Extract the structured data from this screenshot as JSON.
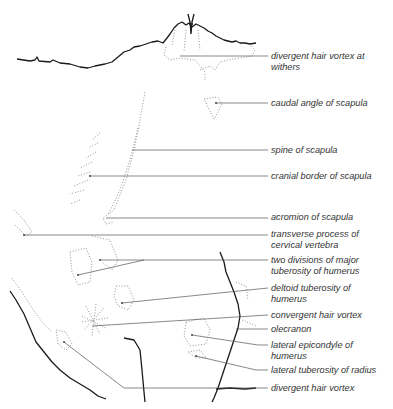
{
  "figure": {
    "labels": [
      {
        "id": "divergent-hair-vortex-withers",
        "lines": [
          "divergent hair vortex at",
          "withers"
        ]
      },
      {
        "id": "caudal-angle-of-scapula",
        "lines": [
          "caudal angle of scapula"
        ]
      },
      {
        "id": "spine-of-scapula",
        "lines": [
          "spine of scapula"
        ]
      },
      {
        "id": "cranial-border-of-scapula",
        "lines": [
          "cranial border of scapula"
        ]
      },
      {
        "id": "acromion-of-scapula",
        "lines": [
          "acromion of scapula"
        ]
      },
      {
        "id": "transverse-process-cervical-vertebra",
        "lines": [
          "transverse process of",
          "cervical vertebra"
        ]
      },
      {
        "id": "two-divisions-major-tuberosity",
        "lines": [
          "two divisions of major",
          "tuberosity of humerus"
        ]
      },
      {
        "id": "deltoid-tuberosity",
        "lines": [
          "deltoid tuberosity of",
          "humerus"
        ]
      },
      {
        "id": "convergent-hair-vortex",
        "lines": [
          "convergent hair vortex"
        ]
      },
      {
        "id": "olecranon",
        "lines": [
          "olecranon"
        ]
      },
      {
        "id": "lateral-epicondyle",
        "lines": [
          "lateral epicondyle of",
          "humerus"
        ]
      },
      {
        "id": "lateral-tuberosity-radius",
        "lines": [
          "lateral tuberosity of radius"
        ]
      },
      {
        "id": "divergent-hair-vortex",
        "lines": [
          "divergent hair vortex"
        ]
      }
    ]
  }
}
